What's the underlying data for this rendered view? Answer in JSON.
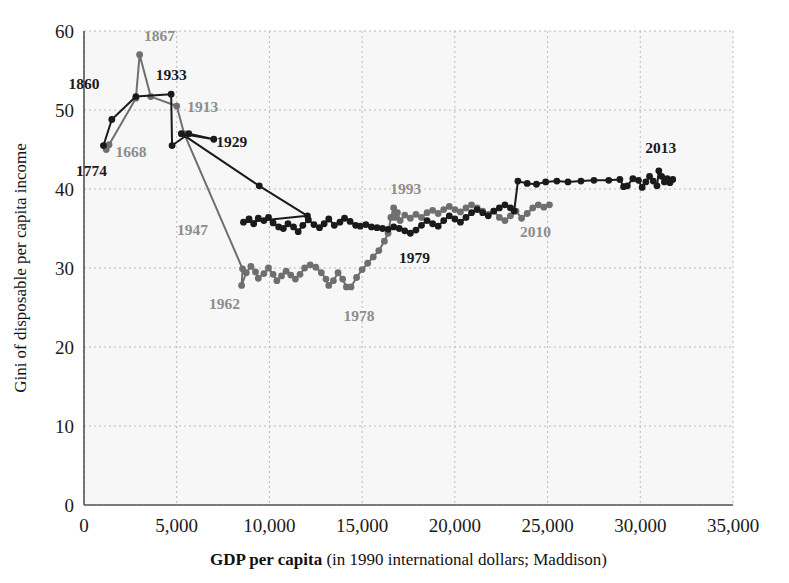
{
  "chart_data": {
    "type": "line",
    "title": "",
    "xlabel_bold": "GDP per capita",
    "xlabel_rest": " (in 1990 international dollars; Maddison)",
    "ylabel": "Gini of disposable per capita income",
    "xlim": [
      0,
      35000
    ],
    "ylim": [
      0,
      60
    ],
    "xticks": [
      0,
      5000,
      10000,
      15000,
      20000,
      25000,
      30000,
      35000
    ],
    "xticklabels": [
      "0",
      "5,000",
      "10,000",
      "15,000",
      "20,000",
      "25,000",
      "30,000",
      "35,000"
    ],
    "yticks": [
      0,
      10,
      20,
      30,
      40,
      50,
      60
    ],
    "yticklabels": [
      "0",
      "10",
      "20",
      "30",
      "40",
      "50",
      "60"
    ],
    "grid": true,
    "grid_style": "dotted",
    "legend": "none",
    "series": [
      {
        "name": "United States",
        "color": "#1a1a1a",
        "marker": "circle",
        "points": [
          [
            1050,
            45.5
          ],
          [
            1500,
            48.8
          ],
          [
            2800,
            51.7
          ],
          [
            4700,
            52.0
          ],
          [
            4750,
            45.5
          ],
          [
            5650,
            47.0
          ],
          [
            7000,
            46.3
          ],
          [
            5250,
            47.0
          ],
          [
            9450,
            40.4
          ],
          [
            12050,
            36.6
          ],
          [
            8600,
            35.8
          ],
          [
            8900,
            36.2
          ],
          [
            9150,
            35.6
          ],
          [
            9400,
            36.3
          ],
          [
            9700,
            36.0
          ],
          [
            9950,
            36.4
          ],
          [
            10200,
            35.7
          ],
          [
            10500,
            35.2
          ],
          [
            10750,
            35.0
          ],
          [
            11000,
            35.6
          ],
          [
            11300,
            35.2
          ],
          [
            11550,
            34.6
          ],
          [
            11800,
            35.4
          ],
          [
            12100,
            36.1
          ],
          [
            12400,
            35.5
          ],
          [
            12700,
            35.1
          ],
          [
            12950,
            35.6
          ],
          [
            13200,
            36.2
          ],
          [
            13500,
            35.4
          ],
          [
            13800,
            35.8
          ],
          [
            14050,
            36.3
          ],
          [
            14350,
            35.9
          ],
          [
            14650,
            35.4
          ],
          [
            14900,
            35.3
          ],
          [
            15200,
            35.5
          ],
          [
            15500,
            35.2
          ],
          [
            15800,
            35.1
          ],
          [
            16100,
            35.0
          ],
          [
            16400,
            34.9
          ],
          [
            16700,
            35.2
          ],
          [
            17000,
            35.0
          ],
          [
            17300,
            34.7
          ],
          [
            17600,
            34.4
          ],
          [
            17900,
            34.8
          ],
          [
            18200,
            35.4
          ],
          [
            18500,
            36.0
          ],
          [
            18800,
            35.6
          ],
          [
            19100,
            35.3
          ],
          [
            19400,
            36.0
          ],
          [
            19700,
            36.6
          ],
          [
            20000,
            36.2
          ],
          [
            20300,
            35.8
          ],
          [
            20600,
            36.4
          ],
          [
            20900,
            37.0
          ],
          [
            21200,
            37.4
          ],
          [
            21500,
            37.0
          ],
          [
            21800,
            36.6
          ],
          [
            22100,
            37.2
          ],
          [
            22400,
            37.6
          ],
          [
            22700,
            38.0
          ],
          [
            23000,
            37.6
          ],
          [
            23200,
            37.2
          ],
          [
            23400,
            41.0
          ],
          [
            23900,
            40.7
          ],
          [
            24400,
            40.6
          ],
          [
            24900,
            40.9
          ],
          [
            25500,
            41.0
          ],
          [
            26100,
            40.9
          ],
          [
            26800,
            41.0
          ],
          [
            27500,
            41.1
          ],
          [
            28300,
            41.1
          ],
          [
            28900,
            41.2
          ],
          [
            29100,
            40.3
          ],
          [
            29300,
            40.4
          ],
          [
            29600,
            41.3
          ],
          [
            29900,
            41.1
          ],
          [
            30100,
            40.2
          ],
          [
            30300,
            40.9
          ],
          [
            30500,
            41.6
          ],
          [
            30700,
            41.0
          ],
          [
            30900,
            40.4
          ],
          [
            31000,
            42.3
          ],
          [
            31150,
            41.6
          ],
          [
            31300,
            40.9
          ],
          [
            31450,
            41.3
          ],
          [
            31600,
            40.8
          ],
          [
            31750,
            41.2
          ]
        ]
      },
      {
        "name": "United Kingdom",
        "color": "#6f6f6f",
        "marker": "circle",
        "points": [
          [
            1200,
            45.0
          ],
          [
            1350,
            45.6
          ],
          [
            2800,
            51.5
          ],
          [
            3000,
            57.0
          ],
          [
            3600,
            51.7
          ],
          [
            5000,
            50.5
          ],
          [
            5400,
            47.0
          ],
          [
            8550,
            29.9
          ],
          [
            8500,
            27.8
          ],
          [
            8750,
            29.4
          ],
          [
            9000,
            30.2
          ],
          [
            9250,
            29.5
          ],
          [
            9400,
            28.7
          ],
          [
            9700,
            29.3
          ],
          [
            9950,
            30.0
          ],
          [
            10200,
            29.2
          ],
          [
            10400,
            28.4
          ],
          [
            10650,
            29.0
          ],
          [
            10900,
            29.6
          ],
          [
            11150,
            29.1
          ],
          [
            11400,
            28.6
          ],
          [
            11650,
            29.2
          ],
          [
            11900,
            30.0
          ],
          [
            12200,
            30.4
          ],
          [
            12500,
            30.1
          ],
          [
            12800,
            29.4
          ],
          [
            13050,
            28.6
          ],
          [
            13200,
            27.8
          ],
          [
            13450,
            28.4
          ],
          [
            13700,
            29.4
          ],
          [
            13950,
            28.6
          ],
          [
            14150,
            27.6
          ],
          [
            14400,
            27.6
          ],
          [
            14700,
            28.8
          ],
          [
            15000,
            29.8
          ],
          [
            15300,
            30.6
          ],
          [
            15600,
            31.4
          ],
          [
            15900,
            32.2
          ],
          [
            16200,
            33.4
          ],
          [
            16400,
            34.4
          ],
          [
            16550,
            36.4
          ],
          [
            16700,
            37.6
          ],
          [
            16750,
            36.4
          ],
          [
            16900,
            37.0
          ],
          [
            17050,
            36.0
          ],
          [
            17300,
            36.7
          ],
          [
            17600,
            36.3
          ],
          [
            17900,
            36.8
          ],
          [
            18200,
            36.4
          ],
          [
            18500,
            37.0
          ],
          [
            18800,
            37.3
          ],
          [
            19100,
            36.9
          ],
          [
            19400,
            37.4
          ],
          [
            19700,
            37.8
          ],
          [
            20000,
            37.4
          ],
          [
            20300,
            37.1
          ],
          [
            20600,
            37.6
          ],
          [
            20900,
            38.0
          ],
          [
            21200,
            37.6
          ],
          [
            21500,
            37.2
          ],
          [
            21800,
            36.8
          ],
          [
            22100,
            37.2
          ],
          [
            22400,
            36.4
          ],
          [
            22700,
            36.0
          ],
          [
            23000,
            36.6
          ],
          [
            23300,
            37.2
          ],
          [
            23600,
            36.3
          ],
          [
            23900,
            36.9
          ],
          [
            24200,
            37.6
          ],
          [
            24500,
            38.0
          ],
          [
            24800,
            37.7
          ],
          [
            25100,
            38.0
          ]
        ]
      }
    ],
    "annotations": [
      {
        "text": "1774",
        "x": 1050,
        "y": 45.5,
        "color": "black",
        "dx": -12,
        "dy": 30
      },
      {
        "text": "1860",
        "x": 2800,
        "y": 51.7,
        "color": "black",
        "dx": -52,
        "dy": -8
      },
      {
        "text": "1933",
        "x": 4700,
        "y": 52.0,
        "color": "black",
        "dx": 0,
        "dy": -14
      },
      {
        "text": "1929",
        "x": 7000,
        "y": 46.3,
        "color": "black",
        "dx": 18,
        "dy": 8
      },
      {
        "text": "1979",
        "x": 17600,
        "y": 34.4,
        "color": "black",
        "dx": 4,
        "dy": 30
      },
      {
        "text": "2013",
        "x": 31000,
        "y": 42.3,
        "color": "black",
        "dx": 2,
        "dy": -18
      },
      {
        "text": "1668",
        "x": 1350,
        "y": 45.6,
        "color": "gray",
        "dx": 22,
        "dy": 12
      },
      {
        "text": "1867",
        "x": 3000,
        "y": 57.0,
        "color": "gray",
        "dx": 20,
        "dy": -14
      },
      {
        "text": "1913",
        "x": 5000,
        "y": 50.5,
        "color": "gray",
        "dx": 26,
        "dy": 6
      },
      {
        "text": "1947",
        "x": 7900,
        "y": 35.0,
        "color": "gray",
        "dx": -38,
        "dy": 6
      },
      {
        "text": "1962",
        "x": 8550,
        "y": 29.9,
        "color": "gray",
        "dx": -18,
        "dy": 40
      },
      {
        "text": "1978",
        "x": 14400,
        "y": 27.6,
        "color": "gray",
        "dx": 8,
        "dy": 34
      },
      {
        "text": "1993",
        "x": 16700,
        "y": 37.6,
        "color": "gray",
        "dx": 12,
        "dy": -14
      },
      {
        "text": "2010",
        "x": 25100,
        "y": 38.0,
        "color": "gray",
        "dx": -14,
        "dy": 32
      }
    ]
  },
  "colors": {
    "series_black": "#1a1a1a",
    "series_gray": "#6f6f6f",
    "label_gray": "#8d8d8d",
    "axis": "#555555",
    "grid": "#b8b8b8",
    "plot_background": "#f7f7f7"
  }
}
